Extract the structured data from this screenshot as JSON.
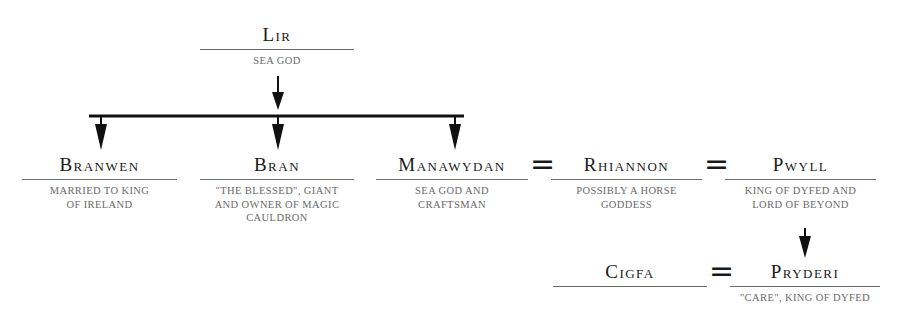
{
  "diagram": {
    "type": "family-tree",
    "nodes": {
      "lir": {
        "name": "Lir",
        "desc": "Sea god"
      },
      "branwen": {
        "name": "Branwen",
        "desc_lines": [
          "Married to king",
          "of Ireland"
        ]
      },
      "bran": {
        "name": "Bran",
        "desc_lines": [
          "\"The blessed\", giant",
          "and owner of magic",
          "cauldron"
        ]
      },
      "manawydan": {
        "name": "Manawydan",
        "desc_lines": [
          "Sea god and",
          "craftsman"
        ]
      },
      "rhiannon": {
        "name": "Rhiannon",
        "desc_lines": [
          "Possibly a horse",
          "goddess"
        ]
      },
      "pwyll": {
        "name": "Pwyll",
        "desc_lines": [
          "King of Dyfed and",
          "lord of Beyond"
        ]
      },
      "cigfa": {
        "name": "Cigfa",
        "desc": ""
      },
      "pryderi": {
        "name": "Pryderi",
        "desc": "\"Care\", king of Dyfed"
      }
    },
    "marriage_symbol": "=",
    "relations": {
      "parent_child": [
        [
          "Lir",
          "Branwen"
        ],
        [
          "Lir",
          "Bran"
        ],
        [
          "Lir",
          "Manawydan"
        ],
        [
          "Pwyll",
          "Pryderi"
        ]
      ],
      "marriages": [
        [
          "Manawydan",
          "Rhiannon"
        ],
        [
          "Rhiannon",
          "Pwyll"
        ],
        [
          "Cigfa",
          "Pryderi"
        ]
      ]
    }
  }
}
